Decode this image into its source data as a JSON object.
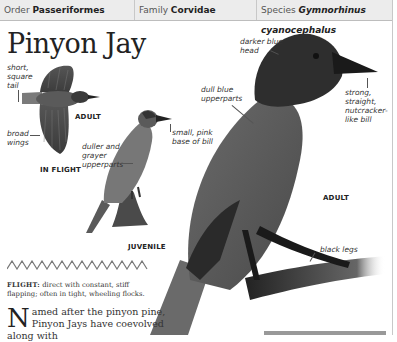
{
  "header": {
    "order_label": "Order",
    "order_value": "Passeriformes",
    "family_label": "Family",
    "family_value": "Corvidae",
    "species_label": "Species",
    "species_value": "Gymnorhinus cyanocephalus"
  },
  "title": "Pinyon Jay",
  "illustrations": {
    "in_flight": {
      "caption": "IN FLIGHT",
      "age_label": "ADULT",
      "labels": [
        "short, square tail",
        "broad wings"
      ]
    },
    "juvenile": {
      "caption": "JUVENILE",
      "labels": [
        "duller and grayer upperparts",
        "small, pink base of bill"
      ]
    },
    "adult": {
      "caption": "ADULT",
      "labels": [
        "darker blue head",
        "dull blue upperparts",
        "strong, straight, nutcracker-like bill",
        "black legs"
      ]
    }
  },
  "labels": {
    "short_square_tail": [
      "short,",
      "square",
      "tail"
    ],
    "broad_wings": [
      "broad",
      "wings"
    ],
    "duller_grayer": [
      "duller and",
      "grayer",
      "upperparts"
    ],
    "small_pink": [
      "small, pink",
      "base of bill"
    ],
    "darker_blue_head": [
      "darker blue",
      "head"
    ],
    "dull_blue_upperparts": [
      "dull blue",
      "upperparts"
    ],
    "strong_bill": [
      "strong,",
      "straight,",
      "nutcracker-",
      "like bill"
    ],
    "black_legs": "black legs"
  },
  "flight": {
    "label": "FLIGHT:",
    "text": "direct with constant, stiff flapping; often in tight, wheeling flocks."
  },
  "body": {
    "dropcap": "N",
    "text": "amed after the pinyon pine, Pinyon Jays have coevolved along with"
  },
  "colors": {
    "header_bg": "#ececec",
    "rule": "#c8c8c8",
    "bird_dark": "#2a2a2a",
    "bird_mid": "#6e6e6e"
  }
}
